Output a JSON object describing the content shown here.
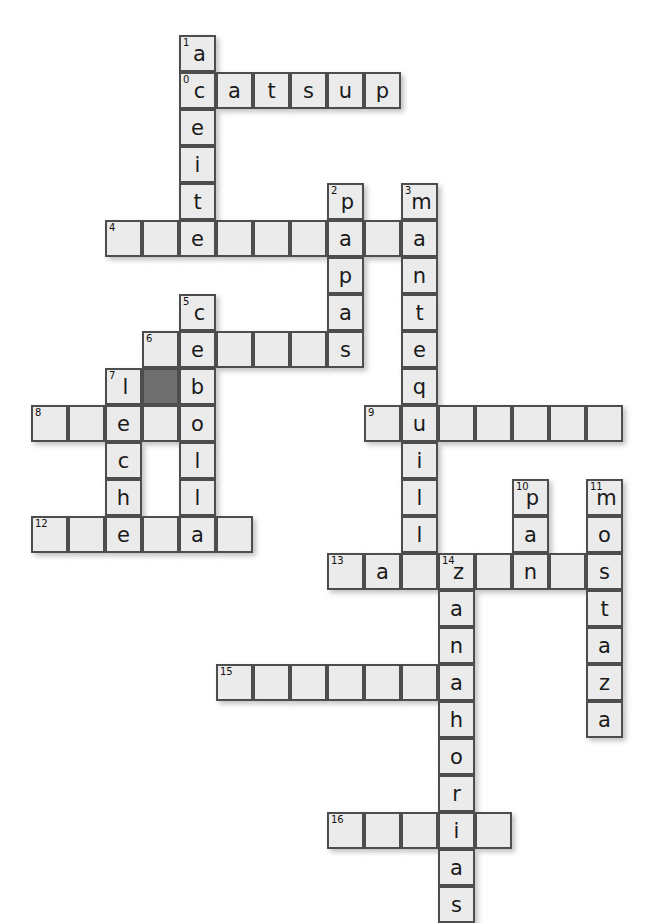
{
  "puzzle": {
    "title": "Crossword Puzzle",
    "cell_size": 37,
    "origin_x": 31,
    "origin_y": 35,
    "columns": 16,
    "rows": 21,
    "colors": {
      "cell_background": "#ebebeb",
      "cell_border": "#4d4d4d",
      "blocked_cell": "#6f6f6f",
      "letter_color": "#1a1a1a",
      "number_color": "#111111",
      "page_background": "#ffffff"
    },
    "words": [
      {
        "number": "0",
        "direction": "across",
        "answer": "catsup",
        "length": 6,
        "row": 1,
        "col": 4
      },
      {
        "number": "1",
        "direction": "down",
        "answer": "aceite",
        "length": 6,
        "row": 0,
        "col": 4
      },
      {
        "number": "2",
        "direction": "down",
        "answer": "papas",
        "length": 5,
        "row": 4,
        "col": 8
      },
      {
        "number": "3",
        "direction": "down",
        "answer": "mantequilla",
        "length": 11,
        "row": 4,
        "col": 10
      },
      {
        "number": "4",
        "direction": "across",
        "answer": "",
        "length": 9,
        "row": 5,
        "col": 2
      },
      {
        "number": "5",
        "direction": "down",
        "answer": "cebolla",
        "length": 7,
        "row": 7,
        "col": 4
      },
      {
        "number": "6",
        "direction": "across",
        "answer": "",
        "length": 7,
        "row": 8,
        "col": 3
      },
      {
        "number": "7",
        "direction": "down",
        "answer": "leche",
        "length": 5,
        "row": 9,
        "col": 2
      },
      {
        "number": "8",
        "direction": "across",
        "answer": "",
        "length": 5,
        "row": 10,
        "col": 0
      },
      {
        "number": "9",
        "direction": "across",
        "answer": "",
        "length": 7,
        "row": 10,
        "col": 9
      },
      {
        "number": "10",
        "direction": "down",
        "answer": "pan",
        "length": 3,
        "row": 12,
        "col": 13
      },
      {
        "number": "11",
        "direction": "down",
        "answer": "mostaza",
        "length": 7,
        "row": 12,
        "col": 15
      },
      {
        "number": "12",
        "direction": "across",
        "answer": "",
        "length": 6,
        "row": 13,
        "col": 0
      },
      {
        "number": "13",
        "direction": "across",
        "answer": "",
        "length": 8,
        "row": 14,
        "col": 8
      },
      {
        "number": "14",
        "direction": "down",
        "answer": "zanahorias",
        "length": 10,
        "row": 14,
        "col": 11
      },
      {
        "number": "15",
        "direction": "across",
        "answer": "",
        "length": 8,
        "row": 17,
        "col": 5
      },
      {
        "number": "16",
        "direction": "across",
        "answer": "",
        "length": 6,
        "row": 20,
        "col": 8
      }
    ],
    "cells": [
      {
        "row": 0,
        "col": 4,
        "letter": "a",
        "number": "1",
        "dark": false
      },
      {
        "row": 1,
        "col": 4,
        "letter": "c",
        "number": "0",
        "dark": false
      },
      {
        "row": 1,
        "col": 5,
        "letter": "a",
        "number": "",
        "dark": false
      },
      {
        "row": 1,
        "col": 6,
        "letter": "t",
        "number": "",
        "dark": false
      },
      {
        "row": 1,
        "col": 7,
        "letter": "s",
        "number": "",
        "dark": false
      },
      {
        "row": 1,
        "col": 8,
        "letter": "u",
        "number": "",
        "dark": false
      },
      {
        "row": 1,
        "col": 9,
        "letter": "p",
        "number": "",
        "dark": false
      },
      {
        "row": 2,
        "col": 4,
        "letter": "e",
        "number": "",
        "dark": false
      },
      {
        "row": 3,
        "col": 4,
        "letter": "i",
        "number": "",
        "dark": false
      },
      {
        "row": 4,
        "col": 4,
        "letter": "t",
        "number": "",
        "dark": false
      },
      {
        "row": 4,
        "col": 8,
        "letter": "p",
        "number": "2",
        "dark": false
      },
      {
        "row": 4,
        "col": 10,
        "letter": "m",
        "number": "3",
        "dark": false
      },
      {
        "row": 5,
        "col": 2,
        "letter": "",
        "number": "4",
        "dark": false
      },
      {
        "row": 5,
        "col": 3,
        "letter": "",
        "number": "",
        "dark": false
      },
      {
        "row": 5,
        "col": 4,
        "letter": "e",
        "number": "",
        "dark": false
      },
      {
        "row": 5,
        "col": 5,
        "letter": "",
        "number": "",
        "dark": false
      },
      {
        "row": 5,
        "col": 6,
        "letter": "",
        "number": "",
        "dark": false
      },
      {
        "row": 5,
        "col": 7,
        "letter": "",
        "number": "",
        "dark": false
      },
      {
        "row": 5,
        "col": 8,
        "letter": "a",
        "number": "",
        "dark": false
      },
      {
        "row": 5,
        "col": 9,
        "letter": "",
        "number": "",
        "dark": false
      },
      {
        "row": 5,
        "col": 10,
        "letter": "a",
        "number": "",
        "dark": false
      },
      {
        "row": 6,
        "col": 8,
        "letter": "p",
        "number": "",
        "dark": false
      },
      {
        "row": 6,
        "col": 10,
        "letter": "n",
        "number": "",
        "dark": false
      },
      {
        "row": 7,
        "col": 4,
        "letter": "c",
        "number": "5",
        "dark": false
      },
      {
        "row": 7,
        "col": 8,
        "letter": "a",
        "number": "",
        "dark": false
      },
      {
        "row": 7,
        "col": 10,
        "letter": "t",
        "number": "",
        "dark": false
      },
      {
        "row": 8,
        "col": 3,
        "letter": "",
        "number": "6",
        "dark": false
      },
      {
        "row": 8,
        "col": 4,
        "letter": "e",
        "number": "",
        "dark": false
      },
      {
        "row": 8,
        "col": 5,
        "letter": "",
        "number": "",
        "dark": false
      },
      {
        "row": 8,
        "col": 6,
        "letter": "",
        "number": "",
        "dark": false
      },
      {
        "row": 8,
        "col": 7,
        "letter": "",
        "number": "",
        "dark": false
      },
      {
        "row": 8,
        "col": 8,
        "letter": "s",
        "number": "",
        "dark": false
      },
      {
        "row": 8,
        "col": 10,
        "letter": "e",
        "number": "",
        "dark": false
      },
      {
        "row": 9,
        "col": 2,
        "letter": "l",
        "number": "7",
        "dark": false
      },
      {
        "row": 9,
        "col": 3,
        "letter": "",
        "number": "",
        "dark": true
      },
      {
        "row": 9,
        "col": 4,
        "letter": "b",
        "number": "",
        "dark": false
      },
      {
        "row": 9,
        "col": 10,
        "letter": "q",
        "number": "",
        "dark": false
      },
      {
        "row": 10,
        "col": 0,
        "letter": "",
        "number": "8",
        "dark": false
      },
      {
        "row": 10,
        "col": 1,
        "letter": "",
        "number": "",
        "dark": false
      },
      {
        "row": 10,
        "col": 2,
        "letter": "e",
        "number": "",
        "dark": false
      },
      {
        "row": 10,
        "col": 3,
        "letter": "",
        "number": "",
        "dark": false
      },
      {
        "row": 10,
        "col": 4,
        "letter": "o",
        "number": "",
        "dark": false
      },
      {
        "row": 10,
        "col": 9,
        "letter": "",
        "number": "9",
        "dark": false
      },
      {
        "row": 10,
        "col": 10,
        "letter": "u",
        "number": "",
        "dark": false
      },
      {
        "row": 10,
        "col": 11,
        "letter": "",
        "number": "",
        "dark": false
      },
      {
        "row": 10,
        "col": 12,
        "letter": "",
        "number": "",
        "dark": false
      },
      {
        "row": 10,
        "col": 13,
        "letter": "",
        "number": "",
        "dark": false
      },
      {
        "row": 10,
        "col": 14,
        "letter": "",
        "number": "",
        "dark": false
      },
      {
        "row": 10,
        "col": 15,
        "letter": "",
        "number": "",
        "dark": false
      },
      {
        "row": 11,
        "col": 2,
        "letter": "c",
        "number": "",
        "dark": false
      },
      {
        "row": 11,
        "col": 4,
        "letter": "l",
        "number": "",
        "dark": false
      },
      {
        "row": 11,
        "col": 10,
        "letter": "i",
        "number": "",
        "dark": false
      },
      {
        "row": 12,
        "col": 2,
        "letter": "h",
        "number": "",
        "dark": false
      },
      {
        "row": 12,
        "col": 4,
        "letter": "l",
        "number": "",
        "dark": false
      },
      {
        "row": 12,
        "col": 10,
        "letter": "l",
        "number": "",
        "dark": false
      },
      {
        "row": 12,
        "col": 13,
        "letter": "p",
        "number": "10",
        "dark": false
      },
      {
        "row": 12,
        "col": 15,
        "letter": "m",
        "number": "11",
        "dark": false
      },
      {
        "row": 13,
        "col": 0,
        "letter": "",
        "number": "12",
        "dark": false
      },
      {
        "row": 13,
        "col": 1,
        "letter": "",
        "number": "",
        "dark": false
      },
      {
        "row": 13,
        "col": 2,
        "letter": "e",
        "number": "",
        "dark": false
      },
      {
        "row": 13,
        "col": 3,
        "letter": "",
        "number": "",
        "dark": false
      },
      {
        "row": 13,
        "col": 4,
        "letter": "a",
        "number": "",
        "dark": false
      },
      {
        "row": 13,
        "col": 5,
        "letter": "",
        "number": "",
        "dark": false
      },
      {
        "row": 13,
        "col": 10,
        "letter": "l",
        "number": "",
        "dark": false
      },
      {
        "row": 13,
        "col": 13,
        "letter": "a",
        "number": "",
        "dark": false
      },
      {
        "row": 13,
        "col": 15,
        "letter": "o",
        "number": "",
        "dark": false
      },
      {
        "row": 14,
        "col": 8,
        "letter": "",
        "number": "13",
        "dark": false
      },
      {
        "row": 14,
        "col": 9,
        "letter": "a",
        "number": "",
        "dark": false
      },
      {
        "row": 14,
        "col": 10,
        "letter": "",
        "number": "",
        "dark": false
      },
      {
        "row": 14,
        "col": 11,
        "letter": "z",
        "number": "14",
        "dark": false
      },
      {
        "row": 14,
        "col": 12,
        "letter": "",
        "number": "",
        "dark": false
      },
      {
        "row": 14,
        "col": 13,
        "letter": "n",
        "number": "",
        "dark": false
      },
      {
        "row": 14,
        "col": 14,
        "letter": "",
        "number": "",
        "dark": false
      },
      {
        "row": 14,
        "col": 15,
        "letter": "s",
        "number": "",
        "dark": false
      },
      {
        "row": 15,
        "col": 11,
        "letter": "a",
        "number": "",
        "dark": false
      },
      {
        "row": 15,
        "col": 15,
        "letter": "t",
        "number": "",
        "dark": false
      },
      {
        "row": 16,
        "col": 11,
        "letter": "n",
        "number": "",
        "dark": false
      },
      {
        "row": 16,
        "col": 15,
        "letter": "a",
        "number": "",
        "dark": false
      },
      {
        "row": 17,
        "col": 5,
        "letter": "",
        "number": "15",
        "dark": false
      },
      {
        "row": 17,
        "col": 6,
        "letter": "",
        "number": "",
        "dark": false
      },
      {
        "row": 17,
        "col": 7,
        "letter": "",
        "number": "",
        "dark": false
      },
      {
        "row": 17,
        "col": 8,
        "letter": "",
        "number": "",
        "dark": false
      },
      {
        "row": 17,
        "col": 9,
        "letter": "",
        "number": "",
        "dark": false
      },
      {
        "row": 17,
        "col": 10,
        "letter": "",
        "number": "",
        "dark": false
      },
      {
        "row": 17,
        "col": 11,
        "letter": "a",
        "number": "",
        "dark": false
      },
      {
        "row": 17,
        "col": 15,
        "letter": "z",
        "number": "",
        "dark": false
      },
      {
        "row": 18,
        "col": 11,
        "letter": "h",
        "number": "",
        "dark": false
      },
      {
        "row": 18,
        "col": 15,
        "letter": "a",
        "number": "",
        "dark": false
      },
      {
        "row": 19,
        "col": 11,
        "letter": "o",
        "number": "",
        "dark": false
      },
      {
        "row": 20,
        "col": 11,
        "letter": "r",
        "number": "",
        "dark": false
      },
      {
        "row": 21,
        "col": 8,
        "letter": "",
        "number": "16",
        "dark": false
      },
      {
        "row": 21,
        "col": 9,
        "letter": "",
        "number": "",
        "dark": false
      },
      {
        "row": 21,
        "col": 10,
        "letter": "",
        "number": "",
        "dark": false
      },
      {
        "row": 21,
        "col": 11,
        "letter": "i",
        "number": "",
        "dark": false
      },
      {
        "row": 21,
        "col": 12,
        "letter": "",
        "number": "",
        "dark": false
      },
      {
        "row": 22,
        "col": 11,
        "letter": "a",
        "number": "",
        "dark": false
      },
      {
        "row": 23,
        "col": 11,
        "letter": "s",
        "number": "",
        "dark": false
      }
    ]
  }
}
